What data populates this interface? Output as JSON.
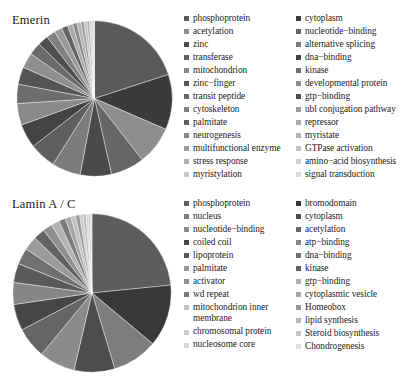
{
  "figure": {
    "background": "#ffffff",
    "panels": [
      "Emerin",
      "Lamin A / C"
    ]
  },
  "emerin": {
    "title": "Emerin",
    "legend_left": [
      "phosphoprotein",
      "acetylation",
      "zinc",
      "transferase",
      "mitochondrion",
      "zinc−finger",
      "transit peptide",
      "cytoskeleton",
      "palmitate",
      "neurogenesis",
      "multifunctional enzyme",
      "stress response",
      "myristylation"
    ],
    "legend_right": [
      "cytoplasm",
      "nucleotide−binding",
      "alternative splicing",
      "dna−binding",
      "kinase",
      "developmental protein",
      "gtp−binding",
      "ubl conjugation pathway",
      "repressor",
      "myristate",
      "GTPase activation",
      "amino−acid biosynthesis",
      "signal transduction"
    ]
  },
  "lamin": {
    "title": "Lamin A / C",
    "legend_left": [
      "phosphoprotein",
      "nucleus",
      "nucleotide−binding",
      "coiled coil",
      "lipoprotein",
      "palmitate",
      "activator",
      "wd repeat",
      "mitochondrion inner membrane",
      "chromosomal protein",
      "nucleosome core"
    ],
    "legend_right": [
      "bromodomain",
      "cytoplasm",
      "acetylation",
      "atp−binding",
      "dna−binding",
      "kinase",
      "gtp−binding",
      "cytoplasmic vesicle",
      "Homeobox",
      "lipid synthesis",
      "Steroid biosynthesis",
      "Chondrogenesis"
    ]
  },
  "chart_data": [
    {
      "type": "pie",
      "title": "Emerin",
      "start_angle_deg": 0,
      "direction": "clockwise",
      "labels": [
        "phosphoprotein",
        "cytoplasm",
        "acetylation",
        "nucleotide−binding",
        "zinc",
        "alternative splicing",
        "transferase",
        "dna−binding",
        "mitochondrion",
        "kinase",
        "zinc−finger",
        "developmental protein",
        "transit peptide",
        "gtp−binding",
        "cytoskeleton",
        "ubl conjugation pathway",
        "palmitate",
        "repressor",
        "neurogenesis",
        "myristate",
        "multifunctional enzyme",
        "GTPase activation",
        "stress response",
        "amino−acid biosynthesis",
        "myristylation",
        "signal transduction"
      ],
      "values": [
        20.0,
        11.5,
        8.0,
        7.0,
        6.5,
        6.0,
        5.5,
        5.0,
        4.5,
        4.0,
        3.6,
        3.2,
        2.6,
        2.2,
        1.9,
        1.6,
        1.3,
        1.1,
        0.9,
        0.8,
        0.7,
        0.6,
        0.5,
        0.4,
        0.35,
        0.3
      ],
      "colors": [
        "#5a5a5a",
        "#3b3b3b",
        "#8e8e8e",
        "#666666",
        "#4a4a4a",
        "#7c7c7c",
        "#5f5f5f",
        "#434343",
        "#8a8a8a",
        "#6d6d6d",
        "#555555",
        "#909090",
        "#6a6a6a",
        "#4f4f4f",
        "#7f7f7f",
        "#999999",
        "#626262",
        "#aaaaaa",
        "#888888",
        "#b4b4b4",
        "#9e9e9e",
        "#c2c2c2",
        "#b0b0b0",
        "#cfcfcf",
        "#c8c8c8",
        "#dcdcdc"
      ]
    },
    {
      "type": "pie",
      "title": "Lamin A / C",
      "start_angle_deg": 0,
      "direction": "clockwise",
      "labels": [
        "phosphoprotein",
        "bromodomain",
        "nucleus",
        "cytoplasm",
        "nucleotide−binding",
        "acetylation",
        "coiled coil",
        "atp−binding",
        "lipoprotein",
        "dna−binding",
        "palmitate",
        "kinase",
        "activator",
        "gtp−binding",
        "wd repeat",
        "cytoplasmic vesicle",
        "mitochondrion inner membrane",
        "Homeobox",
        "chromosomal protein",
        "lipid synthesis",
        "nucleosome core",
        "Steroid biosynthesis",
        "Chondrogenesis"
      ],
      "values": [
        24.0,
        13.0,
        9.5,
        8.5,
        7.5,
        6.5,
        5.5,
        4.6,
        4.0,
        3.4,
        2.9,
        2.4,
        2.0,
        1.7,
        1.4,
        1.2,
        1.0,
        0.85,
        0.7,
        0.6,
        0.5,
        0.42,
        0.35
      ],
      "colors": [
        "#5d5d5d",
        "#383838",
        "#7d7d7d",
        "#4d4d4d",
        "#8b8b8b",
        "#656565",
        "#464646",
        "#868686",
        "#5a5a5a",
        "#707070",
        "#9a9a9a",
        "#636363",
        "#8f8f8f",
        "#b2b2b2",
        "#7a7a7a",
        "#a6a6a6",
        "#c0c0c0",
        "#999999",
        "#cbcbcb",
        "#b8b8b8",
        "#d6d6d6",
        "#c4c4c4",
        "#e0e0e0"
      ]
    }
  ]
}
